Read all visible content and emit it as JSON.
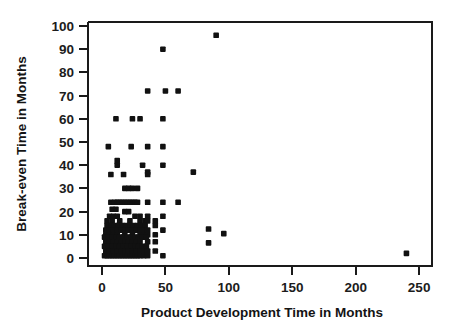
{
  "chart_data": {
    "type": "scatter",
    "title": "",
    "xlabel": "Product Development Time in Months",
    "ylabel": "Break-even Time in Months",
    "xlim": [
      -8,
      262
    ],
    "ylim": [
      -4,
      104
    ],
    "xticks": [
      0,
      50,
      100,
      150,
      200,
      250
    ],
    "yticks": [
      0,
      10,
      20,
      30,
      40,
      50,
      60,
      70,
      80,
      90,
      100
    ],
    "xtick_labels": [
      "0",
      "50",
      "100",
      "150",
      "200",
      "250"
    ],
    "ytick_labels": [
      "0",
      "10",
      "20",
      "30",
      "40",
      "50",
      "60",
      "70",
      "80",
      "90",
      "100"
    ],
    "grid": false,
    "legend": false,
    "marker": "square",
    "marker_color": "#111111",
    "marker_size": 5.6,
    "series": [
      {
        "name": "Products",
        "points": [
          [
            90,
            96
          ],
          [
            48,
            90
          ],
          [
            36,
            72
          ],
          [
            50,
            72
          ],
          [
            60,
            72
          ],
          [
            11,
            60
          ],
          [
            24,
            60
          ],
          [
            30,
            60
          ],
          [
            48,
            60
          ],
          [
            5,
            48
          ],
          [
            23,
            48
          ],
          [
            36,
            48
          ],
          [
            48,
            48
          ],
          [
            12,
            42
          ],
          [
            12,
            40
          ],
          [
            32,
            40
          ],
          [
            48,
            40
          ],
          [
            36,
            37
          ],
          [
            36,
            36
          ],
          [
            7,
            36
          ],
          [
            17,
            36
          ],
          [
            72,
            37
          ],
          [
            18,
            30
          ],
          [
            21,
            30
          ],
          [
            24,
            30
          ],
          [
            28,
            30
          ],
          [
            7,
            24
          ],
          [
            10,
            24
          ],
          [
            12,
            24
          ],
          [
            14,
            24
          ],
          [
            16,
            24
          ],
          [
            18,
            24
          ],
          [
            20,
            24
          ],
          [
            22,
            24
          ],
          [
            24,
            24
          ],
          [
            26,
            24
          ],
          [
            28,
            24
          ],
          [
            36,
            24
          ],
          [
            48,
            24
          ],
          [
            60,
            24
          ],
          [
            8,
            21
          ],
          [
            11,
            21
          ],
          [
            18,
            20
          ],
          [
            21,
            20
          ],
          [
            6,
            18
          ],
          [
            9,
            18
          ],
          [
            12,
            18
          ],
          [
            26,
            18
          ],
          [
            30,
            18
          ],
          [
            36,
            18
          ],
          [
            48,
            18
          ],
          [
            4,
            16
          ],
          [
            8,
            16
          ],
          [
            14,
            16
          ],
          [
            22,
            16
          ],
          [
            30,
            16
          ],
          [
            34,
            16
          ],
          [
            36,
            16
          ],
          [
            42,
            16
          ],
          [
            4,
            14
          ],
          [
            7,
            14
          ],
          [
            10,
            14
          ],
          [
            13,
            14
          ],
          [
            16,
            14
          ],
          [
            19,
            14
          ],
          [
            22,
            14
          ],
          [
            25,
            14
          ],
          [
            28,
            14
          ],
          [
            31,
            14
          ],
          [
            34,
            14
          ],
          [
            42,
            14
          ],
          [
            3,
            12
          ],
          [
            6,
            12
          ],
          [
            9,
            12
          ],
          [
            12,
            12
          ],
          [
            15,
            12
          ],
          [
            18,
            12
          ],
          [
            21,
            12
          ],
          [
            24,
            12
          ],
          [
            27,
            12
          ],
          [
            30,
            12
          ],
          [
            33,
            12
          ],
          [
            36,
            12
          ],
          [
            48,
            12
          ],
          [
            84,
            12.5
          ],
          [
            3,
            10
          ],
          [
            6,
            10
          ],
          [
            9,
            10
          ],
          [
            12,
            10
          ],
          [
            18,
            10
          ],
          [
            24,
            10
          ],
          [
            30,
            10
          ],
          [
            33,
            10
          ],
          [
            36,
            10
          ],
          [
            42,
            10
          ],
          [
            96,
            10.5
          ],
          [
            2,
            9
          ],
          [
            5,
            9
          ],
          [
            8,
            9
          ],
          [
            11,
            9
          ],
          [
            14,
            9
          ],
          [
            17,
            9
          ],
          [
            20,
            9
          ],
          [
            23,
            9
          ],
          [
            26,
            9
          ],
          [
            29,
            9
          ],
          [
            32,
            9
          ],
          [
            35,
            9
          ],
          [
            3,
            7
          ],
          [
            6,
            7
          ],
          [
            9,
            7
          ],
          [
            12,
            7
          ],
          [
            15,
            7
          ],
          [
            18,
            7
          ],
          [
            21,
            7
          ],
          [
            24,
            7
          ],
          [
            27,
            7
          ],
          [
            30,
            7
          ],
          [
            36,
            7
          ],
          [
            42,
            7
          ],
          [
            84,
            6.5
          ],
          [
            2,
            5
          ],
          [
            5,
            5
          ],
          [
            8,
            5
          ],
          [
            11,
            5
          ],
          [
            14,
            5
          ],
          [
            17,
            5
          ],
          [
            20,
            5
          ],
          [
            23,
            5
          ],
          [
            26,
            5
          ],
          [
            29,
            5
          ],
          [
            32,
            5
          ],
          [
            35,
            5
          ],
          [
            3,
            3
          ],
          [
            6,
            3
          ],
          [
            9,
            3
          ],
          [
            12,
            3
          ],
          [
            15,
            3
          ],
          [
            18,
            3
          ],
          [
            21,
            3
          ],
          [
            24,
            3
          ],
          [
            27,
            3
          ],
          [
            30,
            3
          ],
          [
            33,
            3
          ],
          [
            36,
            3
          ],
          [
            42,
            3
          ],
          [
            2,
            1
          ],
          [
            4,
            1
          ],
          [
            6,
            1
          ],
          [
            8,
            1
          ],
          [
            10,
            1
          ],
          [
            12,
            1
          ],
          [
            14,
            1
          ],
          [
            16,
            1
          ],
          [
            18,
            1
          ],
          [
            20,
            1
          ],
          [
            22,
            1
          ],
          [
            24,
            1
          ],
          [
            26,
            1
          ],
          [
            28,
            1
          ],
          [
            30,
            1
          ],
          [
            33,
            1
          ],
          [
            36,
            1
          ],
          [
            48,
            1
          ],
          [
            240,
            2
          ]
        ]
      }
    ]
  }
}
